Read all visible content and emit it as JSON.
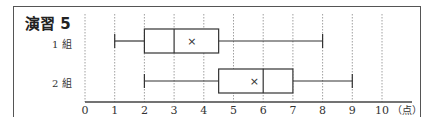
{
  "title": "演習 5",
  "chart_data": {
    "type": "boxplot",
    "title": "演習 5",
    "xlabel": "（点）",
    "ylabel": "",
    "xlim": [
      0,
      10
    ],
    "x_ticks": [
      "0",
      "1",
      "2",
      "3",
      "4",
      "5",
      "6",
      "7",
      "8",
      "9",
      "10"
    ],
    "grid": "vertical dotted",
    "series": [
      {
        "name": "1組",
        "min": 1,
        "q1": 2,
        "median": 3,
        "q3": 4.5,
        "max": 8,
        "mean": 3.6
      },
      {
        "name": "2組",
        "min": 2,
        "q1": 4.5,
        "median": 6,
        "q3": 7,
        "max": 9,
        "mean": 5.7
      }
    ]
  },
  "labels": {
    "group1": "1 組",
    "group2": "2 組",
    "unit": "（点）"
  }
}
